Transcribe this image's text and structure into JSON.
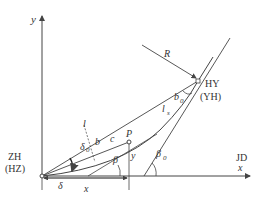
{
  "diagram": {
    "axes": {
      "y_label": "y",
      "x_label": "x",
      "x_end_label": "JD"
    },
    "points": {
      "origin": {
        "label": "ZH",
        "alt_label": "(HZ)"
      },
      "end": {
        "label": "HY",
        "alt_label": "(YH)"
      },
      "p": {
        "label": "P"
      }
    },
    "labels": {
      "radius": "R",
      "chord": "l",
      "spiral_length": "l",
      "spiral_sub": "s",
      "delta": "δ",
      "delta0": "δ",
      "delta0_sub": "0",
      "b": "b",
      "b0": "b",
      "b0_sub": "0",
      "c": "c",
      "beta": "β",
      "beta0": "β",
      "beta0_sub": "0",
      "x_dim": "x",
      "y_dim": "y"
    },
    "colors": {
      "line": "#444444",
      "text": "#333333",
      "background": "#ffffff"
    }
  }
}
